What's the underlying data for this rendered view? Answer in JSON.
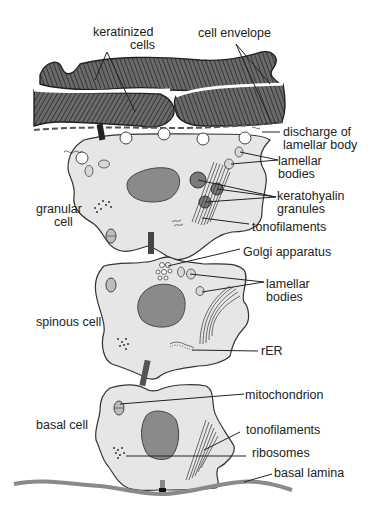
{
  "figure": {
    "colors": {
      "cytoplasm": "#e6e6e6",
      "nucleus": "#8a8a8a",
      "keratinized": "#555555",
      "outline": "#333333",
      "label": "#222222"
    }
  },
  "labels": {
    "keratinized_cells": [
      "keratinized",
      "cells"
    ],
    "cell_envelope": "cell envelope",
    "discharge_lamellar_body": [
      "discharge of",
      "lamellar body"
    ],
    "lamellar_bodies_granular": [
      "lamellar",
      "bodies"
    ],
    "keratohyalin_granules": [
      "keratohyalin",
      "granules"
    ],
    "granular_cell": [
      "granular",
      "cell"
    ],
    "tonofilaments_granular": "tonofilaments",
    "golgi_apparatus": "Golgi apparatus",
    "lamellar_bodies_spinous": [
      "lamellar",
      "bodies"
    ],
    "spinous_cell": "spinous cell",
    "rer": "rER",
    "mitochondrion": "mitochondrion",
    "basal_cell": "basal cell",
    "tonofilaments_basal": "tonofilaments",
    "ribosomes": "ribosomes",
    "basal_lamina": "basal lamina"
  }
}
